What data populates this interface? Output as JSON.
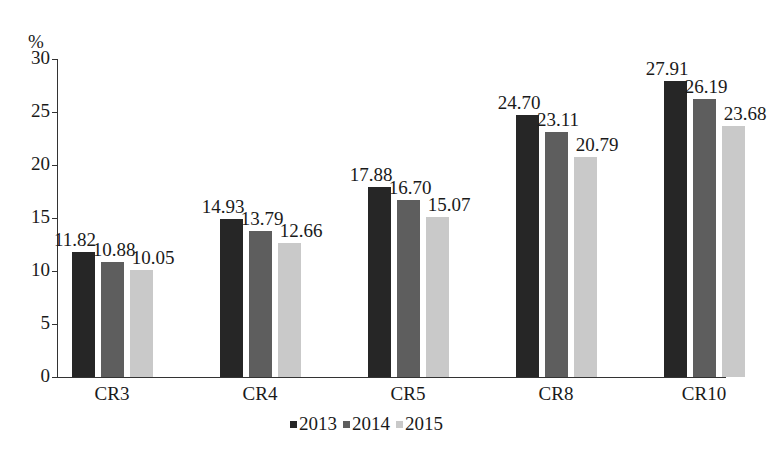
{
  "chart_data": {
    "type": "bar",
    "title": "",
    "xlabel": "",
    "ylabel": "%",
    "ylim": [
      0,
      30
    ],
    "yticks": [
      0,
      5,
      10,
      15,
      20,
      25,
      30
    ],
    "grid": false,
    "legend_position": "bottom",
    "categories": [
      "CR3",
      "CR4",
      "CR5",
      "CR8",
      "CR10"
    ],
    "series": [
      {
        "name": "2013",
        "color": "#262626",
        "values": [
          11.82,
          14.93,
          17.88,
          24.7,
          27.91
        ],
        "labels": [
          "11.82",
          "14.93",
          "17.88",
          "24.70",
          "27.91"
        ]
      },
      {
        "name": "2014",
        "color": "#5e5e5e",
        "values": [
          10.88,
          13.79,
          16.7,
          23.11,
          26.19
        ],
        "labels": [
          "10.88",
          "13.79",
          "16.70",
          "23.11",
          "26.19"
        ]
      },
      {
        "name": "2015",
        "color": "#c9c9c9",
        "values": [
          10.05,
          12.66,
          15.07,
          20.79,
          23.68
        ],
        "labels": [
          "10.05",
          "12.66",
          "15.07",
          "20.79",
          "23.68"
        ]
      }
    ]
  }
}
